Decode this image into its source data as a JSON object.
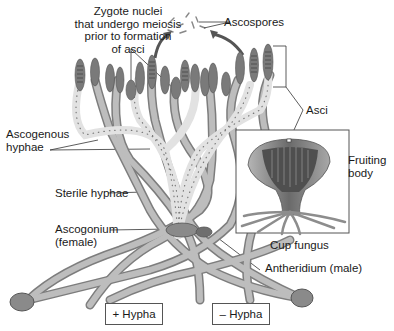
{
  "labels": {
    "zygote_nuclei": [
      "Zygote nuclei",
      "that undergo meiosis",
      "prior to formation",
      "of asci"
    ],
    "ascospores": "Ascospores",
    "asci": "Asci",
    "ascogenous_hyphae": [
      "Ascogenous",
      "hyphae"
    ],
    "fruiting_body": [
      "Fruiting",
      "body"
    ],
    "sterile_hyphae": "Sterile hyphae",
    "ascogonium": [
      "Ascogonium",
      "(female)"
    ],
    "cup_fungus": "Cup fungus",
    "antheridium": "Antheridium (male)",
    "plus_hypha": "+ Hypha",
    "minus_hypha": "– Hypha"
  },
  "colors": {
    "hypha_dark": "#8a8a8a",
    "hypha_light": "#d9d9d9",
    "ascus": "#7a7a7a",
    "cup_outer": "#9a9a9a",
    "cup_inner": "#5a5a5a",
    "line": "#333333"
  }
}
